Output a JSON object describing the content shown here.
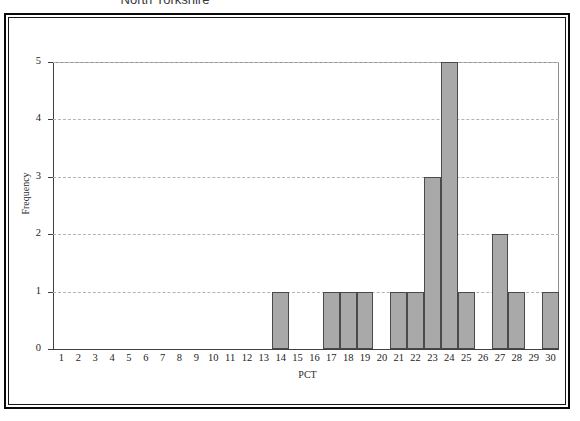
{
  "chart_title": "North Yorkshire",
  "axis": {
    "y_title": "Frequency",
    "x_title": "PCT"
  },
  "chart_data": {
    "type": "bar",
    "title": "North Yorkshire",
    "xlabel": "PCT",
    "ylabel": "Frequency",
    "ylim": [
      0,
      5
    ],
    "y_ticks": [
      0,
      1,
      2,
      3,
      4,
      5
    ],
    "grid": "horizontal-dashed",
    "legend": "none",
    "bar_color": "#a9a9a9",
    "bar_edge_color": "#4a4a4a",
    "categories": [
      "1",
      "2",
      "3",
      "4",
      "5",
      "6",
      "7",
      "8",
      "9",
      "10",
      "11",
      "12",
      "13",
      "14",
      "15",
      "16",
      "17",
      "18",
      "19",
      "20",
      "21",
      "22",
      "23",
      "24",
      "25",
      "26",
      "27",
      "28",
      "29",
      "30"
    ],
    "values": [
      0,
      0,
      0,
      0,
      0,
      0,
      0,
      0,
      0,
      0,
      0,
      0,
      0,
      1,
      0,
      0,
      1,
      1,
      1,
      0,
      1,
      1,
      3,
      5,
      1,
      0,
      2,
      1,
      0,
      1
    ]
  }
}
